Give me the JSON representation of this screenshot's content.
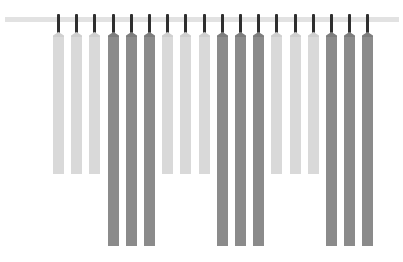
{
  "scene": {
    "description": "Row of paint/fabric swatch strips hanging from a rail",
    "rail_color": "#e2e2e2",
    "hanger_color": "#2f2f2f"
  },
  "swatches": [
    {
      "tone": "light",
      "color": "#d9d9d9",
      "bottom": 174
    },
    {
      "tone": "light",
      "color": "#d9d9d9",
      "bottom": 174
    },
    {
      "tone": "light",
      "color": "#d9d9d9",
      "bottom": 174
    },
    {
      "tone": "dark",
      "color": "#8b8b8b",
      "bottom": 246
    },
    {
      "tone": "dark",
      "color": "#8b8b8b",
      "bottom": 246
    },
    {
      "tone": "dark",
      "color": "#8b8b8b",
      "bottom": 246
    },
    {
      "tone": "light",
      "color": "#d9d9d9",
      "bottom": 174
    },
    {
      "tone": "light",
      "color": "#d9d9d9",
      "bottom": 174
    },
    {
      "tone": "light",
      "color": "#d9d9d9",
      "bottom": 174
    },
    {
      "tone": "dark",
      "color": "#8b8b8b",
      "bottom": 246
    },
    {
      "tone": "dark",
      "color": "#8b8b8b",
      "bottom": 246
    },
    {
      "tone": "dark",
      "color": "#8b8b8b",
      "bottom": 246
    },
    {
      "tone": "light",
      "color": "#d9d9d9",
      "bottom": 174
    },
    {
      "tone": "light",
      "color": "#d9d9d9",
      "bottom": 174
    },
    {
      "tone": "light",
      "color": "#d9d9d9",
      "bottom": 174
    },
    {
      "tone": "dark",
      "color": "#8b8b8b",
      "bottom": 246
    },
    {
      "tone": "dark",
      "color": "#8b8b8b",
      "bottom": 246
    },
    {
      "tone": "dark",
      "color": "#8b8b8b",
      "bottom": 246
    }
  ]
}
